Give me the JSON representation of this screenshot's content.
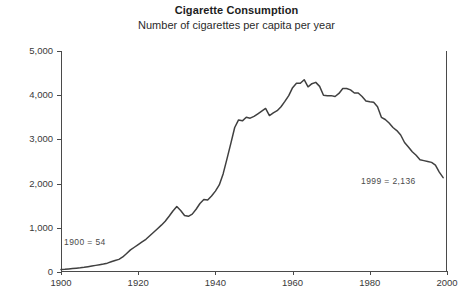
{
  "chart_data": {
    "type": "line",
    "title": "Cigarette Consumption",
    "subtitle": "Number of cigarettes per capita per year",
    "xlabel": "",
    "ylabel": "",
    "xlim": [
      1900,
      2000
    ],
    "ylim": [
      0,
      5000
    ],
    "grid": false,
    "legend": "none",
    "x_ticks": [
      "1900",
      "1920",
      "1940",
      "1960",
      "1980",
      "2000"
    ],
    "x_tick_values": [
      1900,
      1920,
      1940,
      1960,
      1980,
      2000
    ],
    "y_ticks": [
      "0",
      "1,000",
      "2,000",
      "3,000",
      "4,000",
      "5,000"
    ],
    "y_tick_values": [
      0,
      1000,
      2000,
      3000,
      4000,
      5000
    ],
    "annotations": [
      {
        "name": "start-value",
        "text": "1900  =  54",
        "x": 1900,
        "y": 54
      },
      {
        "name": "end-value",
        "text": "1999  =  2,136",
        "x": 1999,
        "y": 2136
      }
    ],
    "series": [
      {
        "name": "Cigarettes per capita per year",
        "color": "#404040",
        "x": [
          1900,
          1901,
          1902,
          1903,
          1904,
          1905,
          1906,
          1907,
          1908,
          1909,
          1910,
          1911,
          1912,
          1913,
          1914,
          1915,
          1916,
          1917,
          1918,
          1919,
          1920,
          1921,
          1922,
          1923,
          1924,
          1925,
          1926,
          1927,
          1928,
          1929,
          1930,
          1931,
          1932,
          1933,
          1934,
          1935,
          1936,
          1937,
          1938,
          1939,
          1940,
          1941,
          1942,
          1943,
          1944,
          1945,
          1946,
          1947,
          1948,
          1949,
          1950,
          1951,
          1952,
          1953,
          1954,
          1955,
          1956,
          1957,
          1958,
          1959,
          1960,
          1961,
          1962,
          1963,
          1964,
          1965,
          1966,
          1967,
          1968,
          1969,
          1970,
          1971,
          1972,
          1973,
          1974,
          1975,
          1976,
          1977,
          1978,
          1979,
          1980,
          1981,
          1982,
          1983,
          1984,
          1985,
          1986,
          1987,
          1988,
          1989,
          1990,
          1991,
          1992,
          1993,
          1994,
          1995,
          1996,
          1997,
          1998,
          1999
        ],
        "values": [
          54,
          60,
          70,
          78,
          86,
          95,
          106,
          120,
          135,
          150,
          165,
          180,
          200,
          230,
          260,
          285,
          340,
          420,
          500,
          560,
          620,
          680,
          740,
          820,
          900,
          980,
          1060,
          1150,
          1260,
          1380,
          1480,
          1390,
          1280,
          1260,
          1310,
          1420,
          1550,
          1640,
          1630,
          1720,
          1830,
          1970,
          2220,
          2560,
          2910,
          3270,
          3440,
          3420,
          3500,
          3480,
          3520,
          3580,
          3640,
          3700,
          3540,
          3600,
          3650,
          3740,
          3860,
          3990,
          4170,
          4270,
          4270,
          4350,
          4190,
          4260,
          4290,
          4200,
          4000,
          3990,
          3990,
          3970,
          4040,
          4150,
          4150,
          4120,
          4050,
          4050,
          3970,
          3870,
          3850,
          3840,
          3740,
          3500,
          3450,
          3370,
          3270,
          3200,
          3100,
          2930,
          2830,
          2720,
          2640,
          2540,
          2520,
          2500,
          2480,
          2420,
          2260,
          2136
        ]
      }
    ]
  }
}
